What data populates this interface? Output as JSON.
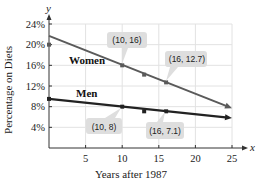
{
  "chart_data": {
    "type": "line",
    "title": "",
    "xlabel": "Years after 1987",
    "ylabel": "Percentage on Diets",
    "x_axis_letter": "x",
    "y_axis_letter": "y",
    "xlim": [
      0,
      25
    ],
    "ylim": [
      0,
      24
    ],
    "x_ticks": [
      5,
      10,
      15,
      20,
      25
    ],
    "y_ticks": [
      4,
      8,
      12,
      16,
      20,
      24
    ],
    "y_tick_labels": [
      "4%",
      "8%",
      "12%",
      "16%",
      "20%",
      "24%"
    ],
    "x_tick_labels": [
      "5",
      "10",
      "15",
      "20",
      "25"
    ],
    "grid": true,
    "series": [
      {
        "name": "Women",
        "color": "#5a5a5a",
        "line": {
          "x": [
            0,
            25
          ],
          "y": [
            21.7,
            7.7
          ]
        },
        "points": [
          {
            "x": 0,
            "y": 20
          },
          {
            "x": 10,
            "y": 16
          },
          {
            "x": 13,
            "y": 14.2
          },
          {
            "x": 16,
            "y": 12.7
          }
        ],
        "callouts": [
          "(10, 16)",
          "(16, 12.7)"
        ]
      },
      {
        "name": "Men",
        "color": "#222222",
        "line": {
          "x": [
            0,
            25
          ],
          "y": [
            9.5,
            5.8
          ]
        },
        "points": [
          {
            "x": 0,
            "y": 9.5
          },
          {
            "x": 10,
            "y": 8
          },
          {
            "x": 13,
            "y": 7.1
          },
          {
            "x": 16,
            "y": 7.1
          }
        ],
        "callouts": [
          "(10, 8)",
          "(16, 7.1)"
        ]
      }
    ]
  },
  "labels": {
    "women": "Women",
    "men": "Men",
    "callout_w1": "(10, 16)",
    "callout_w2": "(16, 12.7)",
    "callout_m1": "(10, 8)",
    "callout_m2": "(16, 7.1)"
  }
}
